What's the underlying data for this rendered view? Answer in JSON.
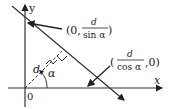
{
  "diagram": {
    "axes": {
      "x_label": "x",
      "y_label": "y",
      "origin_label": "0"
    },
    "points": {
      "y_intercept": {
        "prefix": "(0,",
        "numerator": "d",
        "denominator": "sin α",
        "suffix": ")"
      },
      "x_intercept": {
        "prefix": "(",
        "numerator": "d",
        "denominator": "cos α",
        "suffix": ",0)"
      }
    },
    "perpendicular_label": "d",
    "angle_label": "α",
    "colors": {
      "line": "#333333",
      "text": "#222222",
      "background": "#ffffff"
    }
  }
}
